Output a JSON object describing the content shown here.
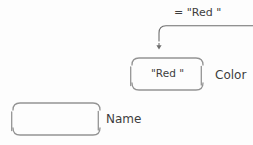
{
  "diagram": {
    "assignment": {
      "expression_label": "= \"Red \""
    },
    "color_box": {
      "value": "\"Red \"",
      "label": "Color"
    },
    "name_box": {
      "value": "",
      "label": "Name"
    },
    "colors": {
      "background": "#fdfdfd",
      "box_stroke": "#949494",
      "arrow_stroke": "#6e6e6e",
      "text": "#3d3d3d"
    }
  }
}
